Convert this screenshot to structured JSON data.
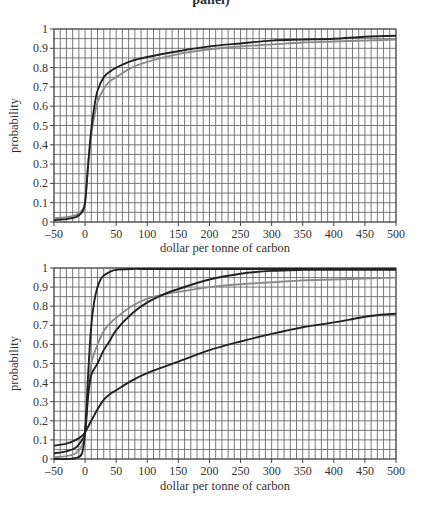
{
  "caption": "panel)",
  "chart_data": [
    {
      "type": "line",
      "title": "",
      "xlabel": "dollar per tonne of carbon",
      "ylabel": "probability",
      "xlim": [
        -50,
        500
      ],
      "ylim": [
        0,
        1
      ],
      "x_ticks": [
        -50,
        0,
        50,
        100,
        150,
        200,
        250,
        300,
        350,
        400,
        450,
        500
      ],
      "x_tick_labels": [
        "–50",
        "0",
        "50",
        "100",
        "150",
        "200",
        "250",
        "300",
        "350",
        "400",
        "450",
        "500"
      ],
      "y_ticks": [
        0,
        0.1,
        0.2,
        0.3,
        0.4,
        0.5,
        0.6,
        0.7,
        0.8,
        0.9,
        1
      ],
      "y_tick_labels": [
        "0",
        "0.1",
        "0.2",
        "0.3",
        "0.4",
        "0.5",
        "0.6",
        "0.7",
        "0.8",
        "0.9",
        "1"
      ],
      "grid": {
        "x_step": 10,
        "y_step": 0.05
      },
      "legend": null,
      "series": [
        {
          "name": "dark curve",
          "color": "#222222",
          "x": [
            -50,
            -30,
            -15,
            -5,
            0,
            5,
            10,
            15,
            20,
            30,
            40,
            50,
            75,
            100,
            150,
            200,
            250,
            300,
            350,
            400,
            450,
            500
          ],
          "values": [
            0.01,
            0.015,
            0.025,
            0.05,
            0.1,
            0.3,
            0.48,
            0.6,
            0.68,
            0.75,
            0.78,
            0.8,
            0.835,
            0.855,
            0.885,
            0.91,
            0.925,
            0.94,
            0.945,
            0.95,
            0.96,
            0.965
          ]
        },
        {
          "name": "gray curve",
          "color": "#8a8a8a",
          "x": [
            -50,
            -30,
            -15,
            -5,
            0,
            5,
            10,
            15,
            20,
            30,
            40,
            50,
            75,
            100,
            150,
            200,
            250,
            300,
            350,
            400,
            450,
            500
          ],
          "values": [
            0.02,
            0.025,
            0.035,
            0.06,
            0.11,
            0.3,
            0.45,
            0.55,
            0.62,
            0.69,
            0.73,
            0.75,
            0.8,
            0.83,
            0.87,
            0.895,
            0.91,
            0.92,
            0.93,
            0.935,
            0.94,
            0.945
          ]
        }
      ]
    },
    {
      "type": "line",
      "title": "",
      "xlabel": "dollar per tonne of carbon",
      "ylabel": "probability",
      "xlim": [
        -50,
        500
      ],
      "ylim": [
        0,
        1
      ],
      "x_ticks": [
        -50,
        0,
        50,
        100,
        150,
        200,
        250,
        300,
        350,
        400,
        450,
        500
      ],
      "x_tick_labels": [
        "–50",
        "0",
        "50",
        "100",
        "150",
        "200",
        "250",
        "300",
        "350",
        "400",
        "450",
        "500"
      ],
      "y_ticks": [
        0,
        0.1,
        0.2,
        0.3,
        0.4,
        0.5,
        0.6,
        0.7,
        0.8,
        0.9,
        1
      ],
      "y_tick_labels": [
        "0",
        "0.1",
        "0.2",
        "0.3",
        "0.4",
        "0.5",
        "0.6",
        "0.7",
        "0.8",
        "0.9",
        "1"
      ],
      "grid": {
        "x_step": 10,
        "y_step": 0.05
      },
      "legend": null,
      "series": [
        {
          "name": "steep dark curve",
          "color": "#222222",
          "x": [
            -50,
            -30,
            -15,
            -5,
            0,
            5,
            10,
            15,
            20,
            25,
            30,
            40,
            50,
            75,
            100,
            150,
            200,
            300,
            400,
            500
          ],
          "values": [
            0.0,
            0.0,
            0.005,
            0.03,
            0.14,
            0.45,
            0.7,
            0.83,
            0.9,
            0.94,
            0.96,
            0.98,
            0.99,
            0.995,
            0.995,
            0.995,
            0.995,
            0.995,
            0.995,
            0.995
          ]
        },
        {
          "name": "gray curve",
          "color": "#8a8a8a",
          "x": [
            -50,
            -30,
            -15,
            -5,
            0,
            5,
            10,
            20,
            30,
            40,
            50,
            75,
            100,
            125,
            150,
            200,
            250,
            300,
            350,
            400,
            450,
            500
          ],
          "values": [
            0.01,
            0.015,
            0.03,
            0.07,
            0.14,
            0.35,
            0.5,
            0.6,
            0.67,
            0.71,
            0.74,
            0.8,
            0.84,
            0.86,
            0.875,
            0.9,
            0.915,
            0.925,
            0.935,
            0.94,
            0.945,
            0.95
          ]
        },
        {
          "name": "middle dark curve",
          "color": "#222222",
          "x": [
            -50,
            -30,
            -15,
            -5,
            0,
            5,
            10,
            20,
            30,
            40,
            50,
            75,
            100,
            125,
            150,
            200,
            250,
            300,
            350,
            400,
            450,
            500
          ],
          "values": [
            0.03,
            0.04,
            0.06,
            0.1,
            0.14,
            0.33,
            0.44,
            0.5,
            0.57,
            0.62,
            0.675,
            0.76,
            0.82,
            0.86,
            0.89,
            0.94,
            0.97,
            0.985,
            0.99,
            0.99,
            0.99,
            0.99
          ]
        },
        {
          "name": "slow dark curve",
          "color": "#222222",
          "x": [
            -50,
            -30,
            -15,
            -5,
            0,
            10,
            20,
            30,
            40,
            50,
            75,
            100,
            150,
            200,
            250,
            300,
            350,
            400,
            425,
            450,
            475,
            500
          ],
          "values": [
            0.07,
            0.08,
            0.1,
            0.12,
            0.14,
            0.2,
            0.26,
            0.31,
            0.34,
            0.36,
            0.41,
            0.45,
            0.51,
            0.57,
            0.615,
            0.655,
            0.69,
            0.715,
            0.73,
            0.745,
            0.755,
            0.76
          ]
        }
      ]
    }
  ]
}
